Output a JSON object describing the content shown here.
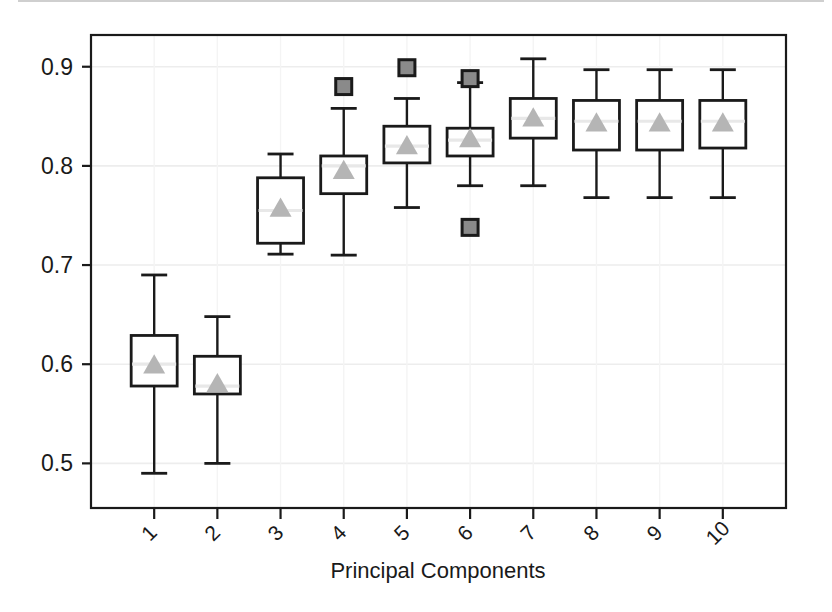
{
  "chart_data": {
    "type": "box",
    "title": "",
    "xlabel": "Principal Components",
    "ylabel": "",
    "categories": [
      "1",
      "2",
      "3",
      "4",
      "5",
      "6",
      "7",
      "8",
      "9",
      "10"
    ],
    "ylim": [
      0.455,
      0.932
    ],
    "yticks": [
      0.5,
      0.6,
      0.7,
      0.8,
      0.9
    ],
    "ytick_labels": [
      "0.5",
      "0.6",
      "0.7",
      "0.8",
      "0.9"
    ],
    "grid": true,
    "grid_axis": "y",
    "legend": "none",
    "colors": {
      "box_edge": "#1a1a1a",
      "box_fill": "#ffffff",
      "whisker": "#1a1a1a",
      "median": "#e8e8e8",
      "mean_marker": "#b5b5b5",
      "outlier_fill": "#8a8a8a",
      "outlier_edge": "#1a1a1a",
      "gridline": "#ededed",
      "frame": "#1a1a1a"
    },
    "marker_styles": {
      "mean": "triangle",
      "outlier": "square",
      "median": "line"
    },
    "boxes": [
      {
        "category": "1",
        "whisker_low": 0.49,
        "q1": 0.578,
        "median": 0.6,
        "mean": 0.599,
        "q3": 0.629,
        "whisker_high": 0.69,
        "outliers": []
      },
      {
        "category": "2",
        "whisker_low": 0.5,
        "q1": 0.57,
        "median": 0.578,
        "mean": 0.58,
        "q3": 0.608,
        "whisker_high": 0.648,
        "outliers": []
      },
      {
        "category": "3",
        "whisker_low": 0.711,
        "q1": 0.722,
        "median": 0.755,
        "mean": 0.757,
        "q3": 0.788,
        "whisker_high": 0.812,
        "outliers": []
      },
      {
        "category": "4",
        "whisker_low": 0.71,
        "q1": 0.772,
        "median": 0.8,
        "mean": 0.795,
        "q3": 0.81,
        "whisker_high": 0.858,
        "outliers": [
          0.88
        ]
      },
      {
        "category": "5",
        "whisker_low": 0.758,
        "q1": 0.803,
        "median": 0.82,
        "mean": 0.82,
        "q3": 0.84,
        "whisker_high": 0.868,
        "outliers": [
          0.899
        ]
      },
      {
        "category": "6",
        "whisker_low": 0.78,
        "q1": 0.81,
        "median": 0.826,
        "mean": 0.827,
        "q3": 0.838,
        "whisker_high": 0.884,
        "outliers": [
          0.888,
          0.738
        ]
      },
      {
        "category": "7",
        "whisker_low": 0.78,
        "q1": 0.828,
        "median": 0.848,
        "mean": 0.848,
        "q3": 0.868,
        "whisker_high": 0.908,
        "outliers": []
      },
      {
        "category": "8",
        "whisker_low": 0.768,
        "q1": 0.816,
        "median": 0.845,
        "mean": 0.843,
        "q3": 0.866,
        "whisker_high": 0.897,
        "outliers": []
      },
      {
        "category": "9",
        "whisker_low": 0.768,
        "q1": 0.816,
        "median": 0.845,
        "mean": 0.843,
        "q3": 0.866,
        "whisker_high": 0.897,
        "outliers": []
      },
      {
        "category": "10",
        "whisker_low": 0.768,
        "q1": 0.818,
        "median": 0.845,
        "mean": 0.843,
        "q3": 0.866,
        "whisker_high": 0.897,
        "outliers": []
      }
    ]
  }
}
